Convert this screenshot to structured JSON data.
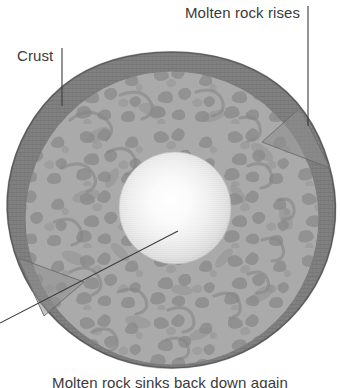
{
  "figure": {
    "width": 340,
    "height": 388,
    "background_color": "#ffffff"
  },
  "labels": {
    "crust": "Crust",
    "molten_rock": "Molten rock rises",
    "bottom_caption": "Molten rock sinks back down again"
  },
  "colors": {
    "crust": "#7e7e7e",
    "crust_dark": "#6e6e6e",
    "mantle": "#a9a9a9",
    "mantle_texture": "#8d8d8d",
    "core_center": "#ffffff",
    "core_edge": "#c9c9c9",
    "leader_line": "#3c3c3c",
    "text": "#3a3a3a"
  },
  "geometry": {
    "planet_center_x": 172,
    "planet_center_y": 218,
    "planet_radius": 166,
    "crust_thickness": 19,
    "core_center_x": 175,
    "core_center_y": 208,
    "core_radius": 56
  },
  "leader_lines": [
    {
      "name": "crust-leader",
      "from_x": 62,
      "from_y": 48,
      "to_x": 62,
      "to_y": 106,
      "orientation": "vertical"
    },
    {
      "name": "molten-rock-leader",
      "from_x": 308,
      "from_y": 6,
      "to_x": 308,
      "to_y": 126,
      "orientation": "vertical"
    },
    {
      "name": "core-leader",
      "from_x": 0,
      "from_y": 323,
      "to_x": 178,
      "to_y": 231,
      "orientation": "diagonal"
    }
  ],
  "layers": [
    {
      "name": "crust",
      "label": "Crust",
      "kind": "outer-ring"
    },
    {
      "name": "mantle",
      "label": "",
      "kind": "middle-ring"
    },
    {
      "name": "core",
      "label": "",
      "kind": "inner-sphere"
    }
  ]
}
